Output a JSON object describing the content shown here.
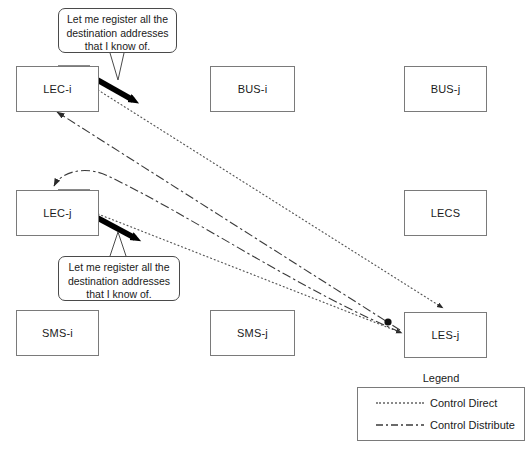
{
  "diagram": {
    "title_present": false,
    "nodes": [
      {
        "id": "lec-i",
        "label": "LEC-i",
        "x": 16,
        "y": 66,
        "w": 81,
        "h": 44
      },
      {
        "id": "bus-i",
        "label": "BUS-i",
        "x": 210,
        "y": 66,
        "w": 83,
        "h": 44
      },
      {
        "id": "bus-j",
        "label": "BUS-j",
        "x": 404,
        "y": 66,
        "w": 81,
        "h": 44
      },
      {
        "id": "lec-j",
        "label": "LEC-j",
        "x": 16,
        "y": 190,
        "w": 81,
        "h": 44
      },
      {
        "id": "lecs",
        "label": "LECS",
        "x": 404,
        "y": 190,
        "w": 81,
        "h": 44
      },
      {
        "id": "sms-i",
        "label": "SMS-i",
        "x": 16,
        "y": 310,
        "w": 81,
        "h": 44
      },
      {
        "id": "sms-j",
        "label": "SMS-j",
        "x": 210,
        "y": 310,
        "w": 83,
        "h": 44
      },
      {
        "id": "les-j",
        "label": "LES-j",
        "x": 404,
        "y": 312,
        "w": 81,
        "h": 44
      }
    ],
    "callouts": [
      {
        "id": "callout-lec-i",
        "text": "Let me register all the destination addresses that I know of.",
        "x": 58,
        "y": 8,
        "w": 119,
        "h": 45
      },
      {
        "id": "callout-lec-j",
        "text": "Let me register all the destination addresses that I know of.",
        "x": 58,
        "y": 256,
        "w": 122,
        "h": 45
      }
    ],
    "legend": {
      "title": "Legend",
      "x": 357,
      "y": 388,
      "w": 168,
      "h": 55,
      "items": [
        {
          "label": "Control Direct",
          "style": "dotted"
        },
        {
          "label": "Control Distribute",
          "style": "dash-dot"
        }
      ]
    },
    "colors": {
      "node_border": "#7a7a7a",
      "line": "#3a3a3a",
      "thick_arrow": "#000000",
      "background": "#ffffff",
      "text": "#1a1a1a"
    },
    "edges": [
      {
        "id": "lec-i-to-les-j-direct",
        "style": "dotted",
        "from": "lec-i",
        "to": "les-j"
      },
      {
        "id": "lec-j-to-les-j-direct",
        "style": "dotted",
        "from": "lec-j",
        "to": "les-j"
      },
      {
        "id": "les-j-to-lec-i-distrib",
        "style": "dash-dot",
        "from": "les-j",
        "to": "lec-i"
      },
      {
        "id": "les-j-to-lec-j-distrib",
        "style": "dash-dot",
        "from": "les-j",
        "to": "lec-j"
      },
      {
        "id": "lec-i-thick-register",
        "style": "thick",
        "from": "lec-i",
        "to": "outward"
      },
      {
        "id": "lec-j-thick-register",
        "style": "thick",
        "from": "lec-j",
        "to": "outward"
      }
    ]
  }
}
